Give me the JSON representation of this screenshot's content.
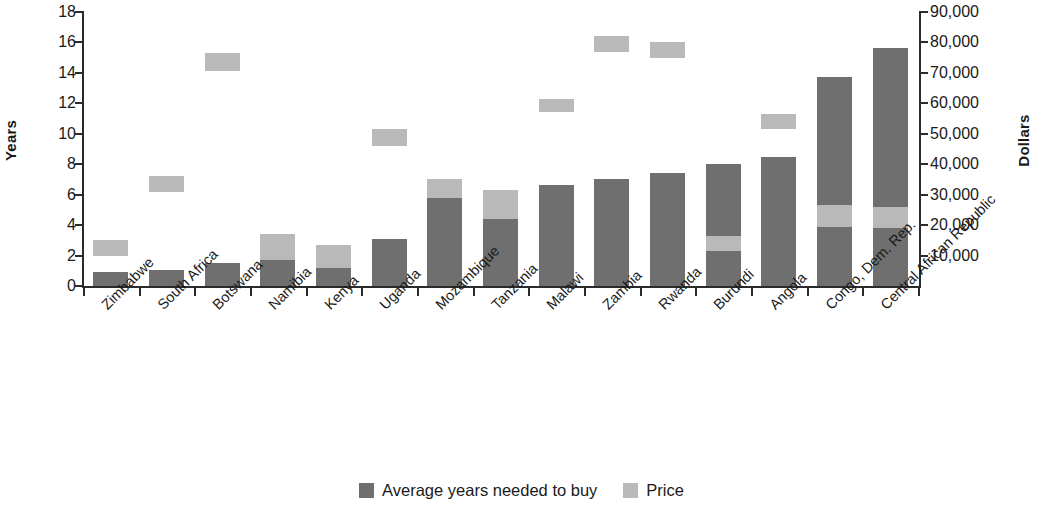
{
  "chart_data": {
    "type": "bar",
    "title": "",
    "subtitle": "",
    "xlabel": "",
    "ylabel": "Years",
    "y2label": "Dollars",
    "ylim": [
      0,
      18
    ],
    "y2lim": [
      0,
      90000
    ],
    "grid": false,
    "legend_position": "bottom-center",
    "stacked": true,
    "y_ticks": [
      "0",
      "2",
      "4",
      "6",
      "8",
      "10",
      "12",
      "14",
      "16",
      "18"
    ],
    "y_tick_values": [
      0,
      2,
      4,
      6,
      8,
      10,
      12,
      14,
      16,
      18
    ],
    "y2_ticks": [
      "10,000",
      "20,000",
      "30,000",
      "40,000",
      "50,000",
      "60,000",
      "70,000",
      "80,000",
      "90,000"
    ],
    "y2_tick_values": [
      10000,
      20000,
      30000,
      40000,
      50000,
      60000,
      70000,
      80000,
      90000
    ],
    "categories": [
      "Zimbabwe",
      "South Africa",
      "Botswana",
      "Namibia",
      "Kenya",
      "Uganda",
      "Mozambique",
      "Tanzania",
      "Malawi",
      "Zambia",
      "Rwanda",
      "Burundi",
      "Angola",
      "Congo, Dem. Rep.",
      "Central African Republic"
    ],
    "series": [
      {
        "name": "Average years needed to buy",
        "color": "#6f6f6f",
        "axis": "left",
        "unit": "years",
        "values": [
          0.9,
          1.05,
          1.5,
          1.7,
          1.2,
          3.1,
          5.8,
          4.4,
          6.65,
          7.0,
          7.4,
          8.0,
          8.5,
          13.7,
          15.65
        ]
      },
      {
        "name": "Price",
        "color": "#b9b9b9",
        "axis": "right",
        "unit": "dollars",
        "values": [
          15000,
          35000,
          75000,
          17000,
          13500,
          50000,
          35000,
          31500,
          60000,
          80000,
          78000,
          16500,
          54000,
          26500,
          26000
        ],
        "values_in_years_scale": [
          3.0,
          7.0,
          15.0,
          3.4,
          2.7,
          10.0,
          7.0,
          6.3,
          12.0,
          16.0,
          15.6,
          3.3,
          10.8,
          5.3,
          5.2
        ]
      }
    ],
    "bar_segments": [
      {
        "category": "Zimbabwe",
        "dark_bottom": 0.0,
        "dark_top": 0.9,
        "price_bottom": 2.0,
        "price_top": 3.0,
        "dark_top2": null
      },
      {
        "category": "South Africa",
        "dark_bottom": 0.0,
        "dark_top": 1.05,
        "price_bottom": 6.2,
        "price_top": 7.2,
        "dark_top2": null
      },
      {
        "category": "Botswana",
        "dark_bottom": 0.0,
        "dark_top": 1.5,
        "price_bottom": 14.1,
        "price_top": 15.3,
        "dark_top2": null
      },
      {
        "category": "Namibia",
        "dark_bottom": 0.0,
        "dark_top": 1.7,
        "price_bottom": 1.7,
        "price_top": 3.4,
        "dark_top2": null
      },
      {
        "category": "Kenya",
        "dark_bottom": 0.0,
        "dark_top": 1.2,
        "price_bottom": 1.2,
        "price_top": 2.7,
        "dark_top2": null
      },
      {
        "category": "Uganda",
        "dark_bottom": 0.0,
        "dark_top": 3.1,
        "price_bottom": 9.2,
        "price_top": 10.3,
        "dark_top2": null
      },
      {
        "category": "Mozambique",
        "dark_bottom": 0.0,
        "dark_top": 5.8,
        "price_bottom": 5.8,
        "price_top": 7.0,
        "dark_top2": null
      },
      {
        "category": "Tanzania",
        "dark_bottom": 0.0,
        "dark_top": 4.4,
        "price_bottom": 4.4,
        "price_top": 6.3,
        "dark_top2": null
      },
      {
        "category": "Malawi",
        "dark_bottom": 0.0,
        "dark_top": 6.65,
        "price_bottom": 11.4,
        "price_top": 12.3,
        "dark_top2": null
      },
      {
        "category": "Zambia",
        "dark_bottom": 0.0,
        "dark_top": 7.0,
        "price_bottom": 15.4,
        "price_top": 16.4,
        "dark_top2": null
      },
      {
        "category": "Rwanda",
        "dark_bottom": 0.0,
        "dark_top": 7.4,
        "price_bottom": 15.0,
        "price_top": 16.05,
        "dark_top2": null
      },
      {
        "category": "Burundi",
        "dark_bottom": 0.0,
        "dark_top": 2.3,
        "price_bottom": 2.3,
        "price_top": 3.3,
        "dark_top2": 8.0
      },
      {
        "category": "Angola",
        "dark_bottom": 0.0,
        "dark_top": 8.5,
        "price_bottom": 10.3,
        "price_top": 11.3,
        "dark_top2": null
      },
      {
        "category": "Congo, Dem. Rep.",
        "dark_bottom": 0.0,
        "dark_top": 3.85,
        "price_bottom": 3.85,
        "price_top": 5.3,
        "dark_top2": 13.7
      },
      {
        "category": "Central African Republic",
        "dark_bottom": 0.0,
        "dark_top": 3.8,
        "price_bottom": 3.8,
        "price_top": 5.2,
        "dark_top2": 15.65
      }
    ]
  },
  "legend": {
    "items": [
      {
        "label": "Average years needed to buy",
        "color": "#6f6f6f"
      },
      {
        "label": "Price",
        "color": "#b9b9b9"
      }
    ]
  }
}
